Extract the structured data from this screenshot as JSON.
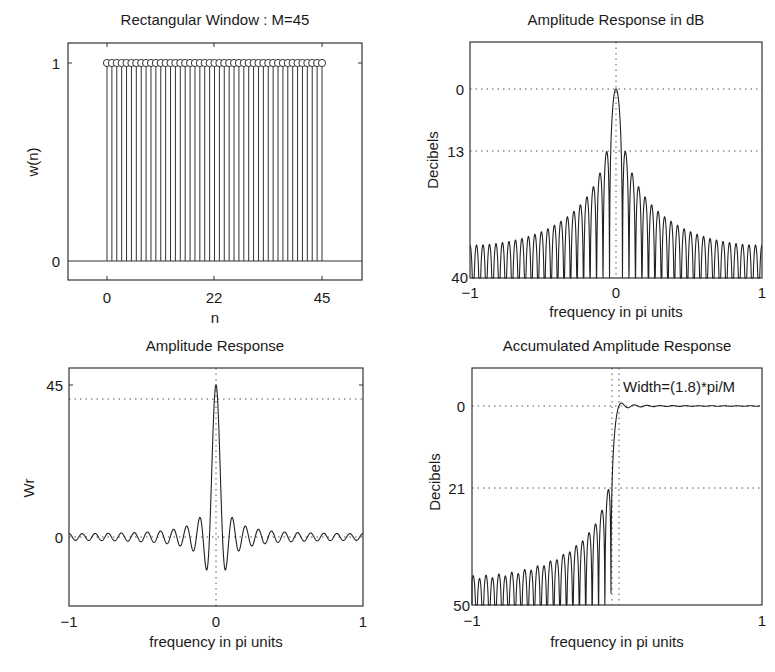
{
  "figure": {
    "panels": [
      {
        "id": "rect-window",
        "title": "Rectangular Window : M=45",
        "xlabel": "n",
        "ylabel": "w(n)",
        "xticks": [
          "0",
          "22",
          "45"
        ],
        "yticks": [
          "0",
          "1"
        ]
      },
      {
        "id": "amp-db",
        "title": "Amplitude Response in dB",
        "xlabel": "frequency in pi units",
        "ylabel": "Decibels",
        "xticks": [
          "−1",
          "0",
          "1"
        ],
        "yticks": [
          "0",
          "13",
          "40"
        ]
      },
      {
        "id": "amp-resp",
        "title": "Amplitude Response",
        "xlabel": "frequency in pi units",
        "ylabel": "Wr",
        "xticks": [
          "−1",
          "0",
          "1"
        ],
        "yticks": [
          "0",
          "45"
        ]
      },
      {
        "id": "accum-amp",
        "title": "Accumulated Amplitude Response",
        "xlabel": "frequency in pi units",
        "ylabel": "Decibels",
        "xticks": [
          "−1",
          "1"
        ],
        "yticks": [
          "0",
          "21",
          "50"
        ],
        "annotation": "Width=(1.8)*pi/M"
      }
    ]
  },
  "chart_data": [
    {
      "type": "stem",
      "title": "Rectangular Window : M=45",
      "xlabel": "n",
      "ylabel": "w(n)",
      "x_range": [
        0,
        44
      ],
      "values_description": "w(n)=1 for n=0..44",
      "n_points": 45,
      "value": 1,
      "xlim": [
        -8,
        52
      ],
      "ylim": [
        -0.1,
        1.1
      ],
      "xticks": [
        0,
        22,
        45
      ],
      "yticks": [
        0,
        1
      ],
      "grid": false
    },
    {
      "type": "line",
      "title": "Amplitude Response in dB",
      "xlabel": "frequency in pi units",
      "ylabel": "Decibels",
      "xlim": [
        -1,
        1
      ],
      "ylim": [
        -40,
        10
      ],
      "yticks": [
        0,
        -13,
        -40
      ],
      "ytick_labels": [
        "0",
        "13",
        "40"
      ],
      "xticks": [
        -1,
        0,
        1
      ],
      "peak_db": 0,
      "first_sidelobe_db": -13,
      "grid": "dotted at y=0, y=-13, x=0",
      "M": 45
    },
    {
      "type": "line",
      "title": "Amplitude Response",
      "xlabel": "frequency in pi units",
      "ylabel": "Wr",
      "xlim": [
        -1,
        1
      ],
      "ylim": [
        -13,
        48
      ],
      "yticks": [
        0,
        45
      ],
      "xticks": [
        -1,
        0,
        1
      ],
      "peak": 45,
      "min_value": -9.5,
      "dotted_reference_line": 41.5,
      "grid": "dotted at y=0, x=0",
      "M": 45
    },
    {
      "type": "line",
      "title": "Accumulated Amplitude Response",
      "xlabel": "frequency in pi units",
      "ylabel": "Decibels",
      "xlim": [
        -1,
        1
      ],
      "ylim": [
        -50,
        8
      ],
      "yticks": [
        0,
        -21,
        -50
      ],
      "ytick_labels": [
        "0",
        "21",
        "50"
      ],
      "xticks": [
        -1,
        1
      ],
      "min_stopband_attenuation_db": 21,
      "transition_width": "1.8*pi/M",
      "transition_edges": [
        -0.04,
        0.0
      ],
      "annotation": "Width=(1.8)*pi/M",
      "grid": "dotted at y=0, y=-21, vertical at transition edges",
      "M": 45
    }
  ],
  "layout": {
    "axes": {
      "rect-window": {
        "x0": 68,
        "y0": 43,
        "x1": 362,
        "y1": 280
      },
      "amp-db": {
        "x0": 470,
        "y0": 42,
        "x1": 762,
        "y1": 278
      },
      "amp-resp": {
        "x0": 69,
        "y0": 368,
        "x1": 363,
        "y1": 606
      },
      "accum-amp": {
        "x0": 472,
        "y0": 368,
        "x1": 762,
        "y1": 605
      }
    }
  }
}
